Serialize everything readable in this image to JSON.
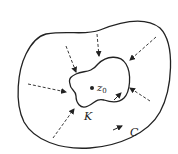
{
  "diagram": {
    "labels": {
      "point": "z",
      "point_sub": "0",
      "inner_contour": "K",
      "outer_contour": "C"
    },
    "colors": {
      "stroke": "#222222",
      "background": "#ffffff"
    },
    "arrows": {
      "count": 7,
      "style": "dashed",
      "direction": "from C inward to K"
    }
  }
}
